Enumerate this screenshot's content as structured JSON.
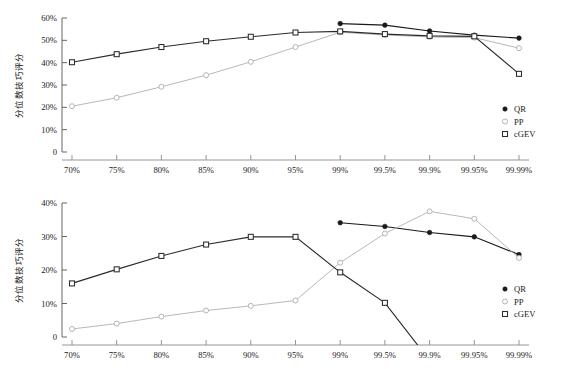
{
  "figure": {
    "background": "#ffffff",
    "series_colors": {
      "QR": "#1a1a1a",
      "PP": "#b0b0b0",
      "cGEV": "#2b2b2b"
    }
  },
  "chart_data": [
    {
      "type": "line",
      "panel": "top",
      "title": "",
      "xlabel": "",
      "ylabel": "分位数技巧评分",
      "x": [
        "70%",
        "75%",
        "80%",
        "85%",
        "90%",
        "95%",
        "99%",
        "99.5%",
        "99.9%",
        "99.95%",
        "99.99%"
      ],
      "categories": [
        "70%",
        "75%",
        "80%",
        "85%",
        "90%",
        "95%",
        "99%",
        "99.5%",
        "99.9%",
        "99.95%",
        "99.99%"
      ],
      "ylim": [
        0,
        60
      ],
      "yticks": [
        0,
        10,
        20,
        30,
        40,
        50,
        60
      ],
      "ytick_labels": [
        "0",
        "10%",
        "20%",
        "30%",
        "40%",
        "50%",
        "60%"
      ],
      "grid": false,
      "legend_position": "right-middle",
      "series": [
        {
          "name": "QR",
          "marker": "filled-circle",
          "color": "#1a1a1a",
          "values": [
            null,
            null,
            null,
            null,
            null,
            null,
            57.5,
            56.8,
            54.2,
            52.3,
            51.0
          ]
        },
        {
          "name": "PP",
          "marker": "open-circle",
          "color": "#b0b0b0",
          "values": [
            20.5,
            24.3,
            29.2,
            34.4,
            40.4,
            47.0,
            53.6,
            52.4,
            51.5,
            51.2,
            46.5
          ]
        },
        {
          "name": "cGEV",
          "marker": "open-square",
          "color": "#2b2b2b",
          "values": [
            40.2,
            43.8,
            47.0,
            49.6,
            51.6,
            53.5,
            54.0,
            52.8,
            52.0,
            51.8,
            35.0
          ]
        }
      ]
    },
    {
      "type": "line",
      "panel": "bottom",
      "title": "",
      "xlabel": "",
      "ylabel": "分位数技巧评分",
      "x": [
        "70%",
        "75%",
        "80%",
        "85%",
        "90%",
        "95%",
        "99%",
        "99.5%",
        "99.9%",
        "99.95%",
        "99.99%"
      ],
      "categories": [
        "70%",
        "75%",
        "80%",
        "85%",
        "90%",
        "95%",
        "99%",
        "99.5%",
        "99.9%",
        "99.95%",
        "99.99%"
      ],
      "ylim": [
        0,
        40
      ],
      "yticks": [
        0,
        10,
        20,
        30,
        40
      ],
      "ytick_labels": [
        "0",
        "10%",
        "20%",
        "30%",
        "40%"
      ],
      "grid": false,
      "legend_position": "right-bottom",
      "series": [
        {
          "name": "QR",
          "marker": "filled-circle",
          "color": "#1a1a1a",
          "values": [
            null,
            null,
            null,
            null,
            null,
            null,
            34.1,
            33.0,
            31.2,
            29.9,
            24.6
          ]
        },
        {
          "name": "PP",
          "marker": "open-circle",
          "color": "#b0b0b0",
          "values": [
            2.4,
            4.0,
            6.1,
            7.9,
            9.3,
            10.9,
            22.2,
            30.9,
            37.5,
            35.3,
            23.6
          ]
        },
        {
          "name": "cGEV",
          "marker": "open-square",
          "color": "#2b2b2b",
          "values": [
            16.0,
            20.2,
            24.2,
            27.6,
            29.9,
            29.9,
            19.3,
            10.2,
            -7.0,
            null,
            null
          ]
        }
      ]
    }
  ],
  "panels": {
    "top": {
      "y_axis_title": "分位数技巧评分",
      "y_tick_labels": [
        "60%",
        "50%",
        "40%",
        "30%",
        "20%",
        "10%",
        "0"
      ],
      "legend": [
        {
          "label": "QR",
          "marker": "filled-circle"
        },
        {
          "label": "PP",
          "marker": "open-circle"
        },
        {
          "label": "cGEV",
          "marker": "open-square"
        }
      ]
    },
    "bottom": {
      "y_axis_title": "分位数技巧评分",
      "y_tick_labels": [
        "40%",
        "30%",
        "20%",
        "10%",
        "0"
      ],
      "x_tick_labels": [
        "70%",
        "75%",
        "80%",
        "85%",
        "90%",
        "95%",
        "99%",
        "99.5%",
        "99.9%",
        "99.95%",
        "99.99%"
      ],
      "legend": [
        {
          "label": "QR",
          "marker": "filled-circle"
        },
        {
          "label": "PP",
          "marker": "open-circle"
        },
        {
          "label": "cGEV",
          "marker": "open-square"
        }
      ]
    }
  }
}
